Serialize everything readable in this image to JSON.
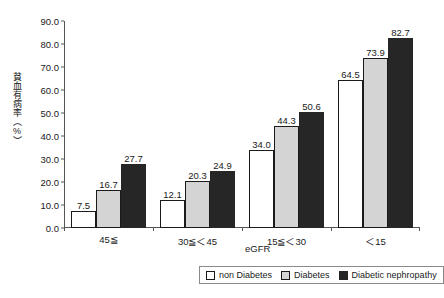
{
  "chart_data": {
    "type": "bar",
    "title": "",
    "subtitle": "",
    "xlabel": "eGFR",
    "ylabel": "貧血有病率（%）",
    "categories": [
      "45≦",
      "30≦＜45",
      "15≦＜30",
      "＜15"
    ],
    "series": [
      {
        "name": "non Diabetes",
        "values": [
          7.5,
          12.1,
          34.0,
          64.5
        ],
        "color": "#ffffff"
      },
      {
        "name": "Diabetes",
        "values": [
          16.7,
          20.3,
          44.3,
          73.9
        ],
        "color": "#d4d4d4"
      },
      {
        "name": "Diabetic nephropathy",
        "values": [
          27.7,
          24.9,
          50.6,
          82.7
        ],
        "color": "#262626"
      }
    ],
    "value_labels": [
      [
        "7.5",
        "12.1",
        "34.0",
        "64.5"
      ],
      [
        "16.7",
        "20.3",
        "44.3",
        "73.9"
      ],
      [
        "27.7",
        "24.9",
        "50.6",
        "82.7"
      ]
    ],
    "ylim": [
      0.0,
      90.0
    ],
    "ytick_step": 10.0,
    "yticks": [
      "90.0",
      "80.0",
      "70.0",
      "60.0",
      "50.0",
      "40.0",
      "30.0",
      "20.0",
      "10.0",
      "0.0"
    ],
    "ytick_values": [
      90.0,
      80.0,
      70.0,
      60.0,
      50.0,
      40.0,
      30.0,
      20.0,
      10.0,
      0.0
    ],
    "grid": false,
    "legend_position": "bottom-right",
    "axis_color": "#555555",
    "text_color": "#1a1a1a",
    "background": "#ffffff"
  },
  "legend": {
    "items": [
      {
        "label": "non Diabetes"
      },
      {
        "label": "Diabetes"
      },
      {
        "label": "Diabetic nephropathy"
      }
    ]
  }
}
